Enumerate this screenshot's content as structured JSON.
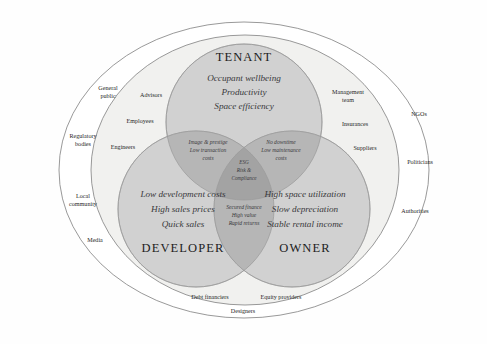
{
  "diagram": {
    "colors": {
      "page_background": "#fefefe",
      "outer_ellipse_fill": "#ffffff",
      "inner_ellipse_fill": "#f2f2f0",
      "circle_fill": "#cfcfcf",
      "overlap_two_fill": "#b9b9b9",
      "overlap_three_fill": "#a6a6a6",
      "stroke": "#8a8a8a",
      "text": "#2b2b2b"
    },
    "circles": [
      {
        "id": "tenant",
        "title": "TENANT",
        "items": [
          "Occupant wellbeing",
          "Productivity",
          "Space efficiency"
        ]
      },
      {
        "id": "developer",
        "title": "DEVELOPER",
        "items": [
          "Low development costs",
          "High sales prices",
          "Quick sales"
        ]
      },
      {
        "id": "owner",
        "title": "OWNER",
        "items": [
          "High space utilization",
          "Slow depreciation",
          "Stable rental income"
        ]
      }
    ],
    "overlaps": [
      {
        "id": "tenant-developer",
        "items": [
          "Image & prestige",
          "Low transaction",
          "costs"
        ]
      },
      {
        "id": "tenant-owner",
        "items": [
          "No downtime",
          "Low maintenance",
          "costs"
        ]
      },
      {
        "id": "developer-owner",
        "items": [
          "Secured finance",
          "High value",
          "Rapid returns"
        ]
      },
      {
        "id": "center-all-three",
        "items": [
          "ESG",
          "Risk &",
          "Compliance"
        ]
      }
    ],
    "inner_ring_labels": [
      {
        "id": "advisors",
        "text": "Advisors"
      },
      {
        "id": "employees",
        "text": "Employees"
      },
      {
        "id": "engineers",
        "text": "Engineers"
      },
      {
        "id": "management-team",
        "text": "Management\nteam"
      },
      {
        "id": "management-team-line1",
        "text": "Management"
      },
      {
        "id": "management-team-line2",
        "text": "team"
      },
      {
        "id": "insurances",
        "text": "Insurances"
      },
      {
        "id": "suppliers",
        "text": "Suppliers"
      },
      {
        "id": "debt-financiers",
        "text": "Debt financiers"
      },
      {
        "id": "equity-providers",
        "text": "Equity providers"
      }
    ],
    "outer_ring_labels": [
      {
        "id": "general-public-line1",
        "text": "General"
      },
      {
        "id": "general-public-line2",
        "text": "public"
      },
      {
        "id": "regulatory-bodies-line1",
        "text": "Regulatory"
      },
      {
        "id": "regulatory-bodies-line2",
        "text": "bodies"
      },
      {
        "id": "local-community-line1",
        "text": "Local"
      },
      {
        "id": "local-community-line2",
        "text": "community"
      },
      {
        "id": "media",
        "text": "Media"
      },
      {
        "id": "designers",
        "text": "Designers"
      },
      {
        "id": "ngos",
        "text": "NGOs"
      },
      {
        "id": "suppliers-outer",
        "text": "Suppliers"
      },
      {
        "id": "politicians",
        "text": "Politicians"
      },
      {
        "id": "authorities",
        "text": "Authorities"
      }
    ]
  },
  "labels": {
    "tenant_title": "TENANT",
    "tenant_l1": "Occupant wellbeing",
    "tenant_l2": "Productivity",
    "tenant_l3": "Space efficiency",
    "developer_title": "DEVELOPER",
    "developer_l1": "Low development costs",
    "developer_l2": "High sales prices",
    "developer_l3": "Quick sales",
    "owner_title": "OWNER",
    "owner_l1": "High space utilization",
    "owner_l2": "Slow depreciation",
    "owner_l3": "Stable rental income",
    "td_l1": "Image & prestige",
    "td_l2": "Low transaction",
    "td_l3": "costs",
    "to_l1": "No downtime",
    "to_l2": "Low maintenance",
    "to_l3": "costs",
    "do_l1": "Secured finance",
    "do_l2": "High value",
    "do_l3": "Rapid returns",
    "core_l1": "ESG",
    "core_l2": "Risk &",
    "core_l3": "Compliance",
    "advisors": "Advisors",
    "employees": "Employees",
    "engineers": "Engineers",
    "mgmt_l1": "Management",
    "mgmt_l2": "team",
    "insurances": "Insurances",
    "suppliers_inner": "Suppliers",
    "debt_financiers": "Debt financiers",
    "equity_providers": "Equity providers",
    "general_l1": "General",
    "general_l2": "public",
    "regulatory_l1": "Regulatory",
    "regulatory_l2": "bodies",
    "local_l1": "Local",
    "local_l2": "community",
    "media": "Media",
    "designers": "Designers",
    "ngos": "NGOs",
    "politicians": "Politicians",
    "authorities": "Authorities"
  }
}
